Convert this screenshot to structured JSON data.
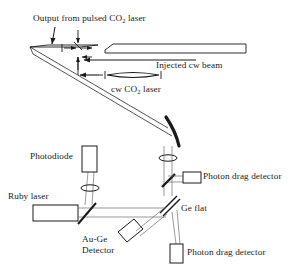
{
  "figure": {
    "type": "optical-setup-diagram",
    "background_color": "#ffffff",
    "line_color": "#1a1a1a",
    "beam_color": "#6e6e6e",
    "width": 301,
    "height": 268
  },
  "labels": {
    "output_pulsed": {
      "pre": "Output from pulsed CO",
      "sub": "2",
      "post": " laser",
      "x": 33,
      "y": 13
    },
    "injected_cw": {
      "text": "Injected cw beam",
      "x": 156,
      "y": 65
    },
    "cw_co2_laser": {
      "pre": "cw CO",
      "sub": "2",
      "post": " laser",
      "x": 111,
      "y": 84
    },
    "photodiode": {
      "text": "Photodiode",
      "x": 30,
      "y": 151
    },
    "ruby_laser": {
      "text": "Ruby laser",
      "x": 8,
      "y": 191
    },
    "photon_drag_detector_right": {
      "text": "Photon drag detector",
      "x": 201,
      "y": 176
    },
    "ge_flat": {
      "text": "Ge flat",
      "x": 180,
      "y": 203
    },
    "au_ge_detector_line1": {
      "text": "Au-Ge",
      "x": 82,
      "y": 238
    },
    "au_ge_detector_line2": {
      "text": "Detector",
      "x": 82,
      "y": 249
    },
    "photon_drag_detector_bottom": {
      "text": "Photon drag detector",
      "x": 187,
      "y": 245
    }
  },
  "components": [
    {
      "name": "output-coupler-mirror",
      "kind": "tilted-flat-mirror",
      "x": 30,
      "y": 47
    },
    {
      "name": "cw-laser-tube",
      "kind": "laser-tube",
      "x": 105,
      "y": 45
    },
    {
      "name": "cw-laser-cavity-element",
      "kind": "lens",
      "x": 118,
      "y": 75
    },
    {
      "name": "steering-mirror",
      "kind": "curved-mirror",
      "x": 172,
      "y": 130
    },
    {
      "name": "focusing-lens-upper",
      "kind": "lens",
      "x": 168,
      "y": 158
    },
    {
      "name": "beamsplitter-upper",
      "kind": "beamsplitter",
      "x": 168,
      "y": 180
    },
    {
      "name": "photon-drag-detector-right",
      "kind": "detector-box",
      "x": 183,
      "y": 174
    },
    {
      "name": "ge-flat",
      "kind": "tilted-window",
      "x": 168,
      "y": 205
    },
    {
      "name": "photodiode",
      "kind": "detector-box",
      "x": 82,
      "y": 146
    },
    {
      "name": "collection-lens",
      "kind": "lens",
      "x": 89,
      "y": 188
    },
    {
      "name": "ruby-laser",
      "kind": "laser-box",
      "x": 33,
      "y": 205
    },
    {
      "name": "ruby-beamsplitter",
      "kind": "beamsplitter",
      "x": 85,
      "y": 211
    },
    {
      "name": "au-ge-detector",
      "kind": "tilted-detector-box",
      "x": 129,
      "y": 229
    },
    {
      "name": "photon-drag-detector-bottom",
      "kind": "detector-box",
      "x": 170,
      "y": 244
    }
  ]
}
